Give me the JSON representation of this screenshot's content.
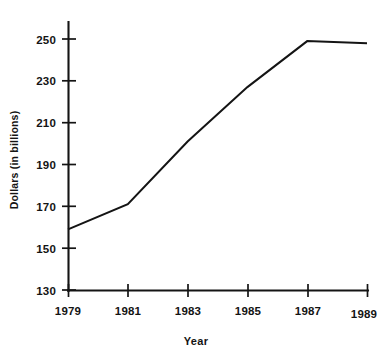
{
  "chart_data": {
    "type": "line",
    "title": "",
    "xlabel": "Year",
    "ylabel": "Dollars (in billions)",
    "x": [
      1979,
      1981,
      1983,
      1985,
      1987,
      1989
    ],
    "values": [
      159,
      171,
      201,
      227,
      249,
      248
    ],
    "series": [
      {
        "name": "Dollars (in billions)",
        "values": [
          159,
          171,
          201,
          227,
          249,
          248
        ]
      }
    ],
    "categories": [
      "1979",
      "1981",
      "1983",
      "1985",
      "1987",
      "1989"
    ],
    "xlim": [
      1979,
      1989
    ],
    "ylim": [
      130,
      255
    ],
    "ytick_labels": [
      "130",
      "150",
      "170",
      "190",
      "210",
      "230",
      "250"
    ],
    "yticks": [
      130,
      150,
      170,
      190,
      210,
      230,
      250
    ],
    "xtick_labels": [
      "1979",
      "1981",
      "1983",
      "1985",
      "1987",
      "1989"
    ],
    "xticks": [
      1979,
      1981,
      1983,
      1985,
      1987,
      1989
    ],
    "grid": false,
    "legend": false,
    "legend_position": "none",
    "line_color": "#141414",
    "background_color": "#ffffff"
  },
  "axes": {
    "y_title": "Dollars (in billions)",
    "x_title": "Year",
    "y_tick_0": "130",
    "y_tick_1": "150",
    "y_tick_2": "170",
    "y_tick_3": "190",
    "y_tick_4": "210",
    "y_tick_5": "230",
    "y_tick_6": "250",
    "x_tick_0": "1979",
    "x_tick_1": "1981",
    "x_tick_2": "1983",
    "x_tick_3": "1985",
    "x_tick_4": "1987",
    "x_tick_5": "1989"
  },
  "artifacts": {
    "cropped_header_text": ""
  }
}
